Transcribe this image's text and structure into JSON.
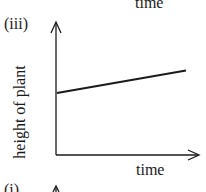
{
  "chart_data": {
    "type": "line",
    "panel_label": "(iii)",
    "title": "",
    "xlabel": "time",
    "ylabel": "height of plant",
    "grid": false,
    "ticks": "none",
    "series": [
      {
        "name": "height of plant",
        "description": "straight line with positive, constant slope starting above zero",
        "points": [
          [
            0,
            0.47
          ],
          [
            1,
            0.64
          ]
        ]
      }
    ],
    "xlim": [
      0,
      1.1
    ],
    "ylim": [
      0,
      1
    ]
  },
  "context": {
    "previous_panel_xlabel": "time",
    "next_panel_label": "(i)"
  }
}
